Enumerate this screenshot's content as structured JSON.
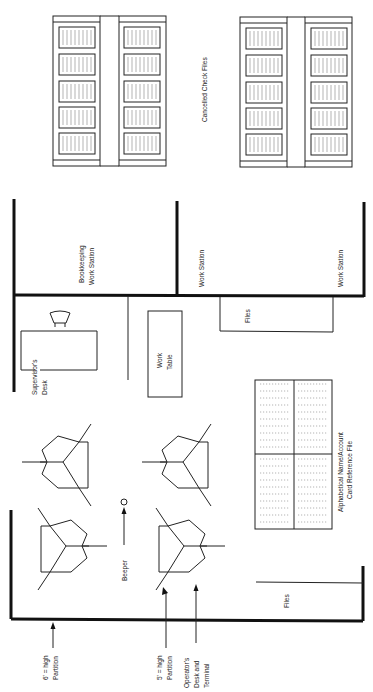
{
  "header": {
    "caption_fragment": ""
  },
  "labels": {
    "cancelled_check_files": "Cancelled Check Files",
    "bookkeeping_line1": "Bookkeeping",
    "bookkeeping_line2": "Work Station",
    "work_station_1": "Work Station",
    "work_station_2": "Work Station",
    "files_upper": "Files",
    "files_lower": "Files",
    "supervisor_line1": "Supervisor's",
    "supervisor_line2": "Desk",
    "work_table_line1": "Work",
    "work_table_line2": "Table",
    "card_file_line1": "Alphabetical Name/Account",
    "card_file_line2": "Card Reference File",
    "beeper": "Beeper",
    "six_ft_line1": "6' = high",
    "six_ft_line2": "Partition",
    "five_ft_line1": "5' = high",
    "five_ft_line2": "Partition",
    "operator_line1": "Operator's",
    "operator_line2": "Desk and",
    "operator_line3": "Terminal"
  },
  "colors": {
    "ink": "#111111",
    "background": "#ffffff"
  },
  "file_cabinets": {
    "count": 4,
    "drawers_per_cabinet": 5
  },
  "operator_desks": {
    "count": 4
  }
}
